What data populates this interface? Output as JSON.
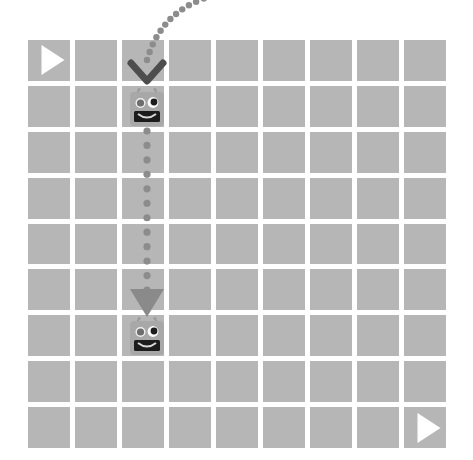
{
  "app": {
    "title": "Robot Grid Puzzle Board",
    "background_color": "#ffffff"
  },
  "board": {
    "name": "grid-board",
    "columns": 9,
    "rows": 9,
    "cell_color": "#b6b6b6",
    "gap_color": "#ffffff",
    "left": 28,
    "top": 40,
    "width": 418,
    "height": 408,
    "cell_gap": 5
  },
  "markers": [
    {
      "name": "play-button-top-left",
      "icon": "play-triangle-icon",
      "color": "#ffffff",
      "row": 1,
      "col": 1,
      "direction": "right"
    },
    {
      "name": "play-button-bottom-right",
      "icon": "play-triangle-icon",
      "color": "#ffffff",
      "row": 9,
      "col": 9,
      "direction": "right"
    }
  ],
  "robots": [
    {
      "name": "robot-top",
      "label": "Robot start",
      "row": 2,
      "col": 3,
      "x": 127,
      "y": 88,
      "size": 40,
      "body_color": "#a8a8a8",
      "mouth_color": "#1c1c1c",
      "eye_left_color": "#6e6e6e",
      "eye_right_color": "#1c1c1c"
    },
    {
      "name": "robot-bottom",
      "label": "Robot destination",
      "row": 7,
      "col": 3,
      "x": 127,
      "y": 317,
      "size": 40,
      "body_color": "#a8a8a8",
      "mouth_color": "#1c1c1c",
      "eye_left_color": "#6e6e6e",
      "eye_right_color": "#1c1c1c"
    }
  ],
  "path": {
    "name": "dotted-motion-path",
    "dot_color": "#8c8c8c",
    "incoming": {
      "name": "incoming-curve",
      "from_x": 212,
      "from_y": -4,
      "to_x": 147,
      "to_y": 60,
      "dot_count": 13,
      "dot_radius": 3.2
    },
    "vertical": {
      "name": "vertical-dotted-segment",
      "x": 147,
      "from_y": 131,
      "to_y": 290,
      "dot_count": 12,
      "dot_radius": 3.6
    }
  },
  "arrows": [
    {
      "name": "chevron-down-arrow",
      "icon": "chevron-down-icon",
      "x": 147,
      "y": 72,
      "color": "#4d4d4d",
      "stroke_width": 7
    },
    {
      "name": "triangle-down-arrow",
      "icon": "triangle-down-icon",
      "x": 147,
      "y": 303,
      "color": "#8a8a8a",
      "width": 34,
      "height": 28
    }
  ]
}
